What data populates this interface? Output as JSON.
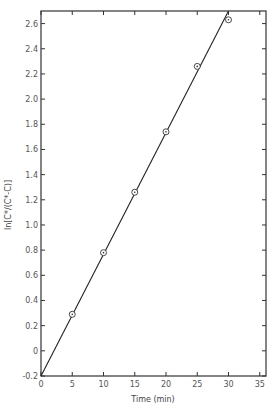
{
  "chart_data": {
    "type": "scatter",
    "title": "",
    "xlabel": "Time (min)",
    "ylabel": "ln[C*/(C*-C)]",
    "xlim": [
      0,
      36
    ],
    "ylim": [
      -0.2,
      2.7
    ],
    "grid": false,
    "legend": null,
    "x_ticks": [
      0,
      5,
      10,
      15,
      20,
      25,
      30,
      35
    ],
    "x_tick_labels": [
      "0",
      "5",
      "10",
      "15",
      "20",
      "25",
      "30",
      "35"
    ],
    "y_ticks": [
      -0.2,
      0,
      0.2,
      0.4,
      0.6,
      0.8,
      1.0,
      1.2,
      1.4,
      1.6,
      1.8,
      2.0,
      2.2,
      2.4,
      2.6
    ],
    "y_tick_labels": [
      "-0.2",
      "0",
      "0.2",
      "0.4",
      "0.6",
      "0.8",
      "1.0",
      "1.2",
      "1.4",
      "1.6",
      "1.8",
      "2.0",
      "2.2",
      "2.4",
      "2.6"
    ],
    "series": [
      {
        "name": "data",
        "marker": "circled-dot",
        "x": [
          5,
          10,
          15,
          20,
          25,
          30
        ],
        "y": [
          0.29,
          0.78,
          1.26,
          1.74,
          2.26,
          2.63
        ]
      },
      {
        "name": "fit",
        "style": "line",
        "x": [
          0,
          30.0
        ],
        "y": [
          -0.2,
          2.7
        ]
      }
    ]
  }
}
